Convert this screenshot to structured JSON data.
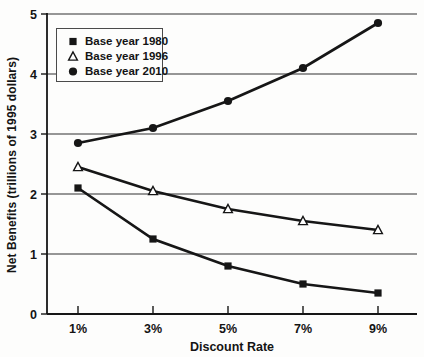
{
  "chart_data": {
    "type": "line",
    "title": "",
    "x_categories": [
      "1%",
      "3%",
      "5%",
      "7%",
      "9%"
    ],
    "series": [
      {
        "name": "Base year 1980",
        "marker": "filled-square",
        "values": [
          2.1,
          1.25,
          0.8,
          0.5,
          0.35
        ]
      },
      {
        "name": "Base year 1996",
        "marker": "open-triangle",
        "values": [
          2.45,
          2.05,
          1.75,
          1.55,
          1.4
        ]
      },
      {
        "name": "Base year 2010",
        "marker": "filled-circle",
        "values": [
          2.85,
          3.1,
          3.55,
          4.1,
          4.85
        ]
      }
    ],
    "xlabel": "Discount Rate",
    "ylabel": "Net Benefits (trillions of 1995 dollars)",
    "ylim": [
      0,
      5
    ],
    "yticks": [
      0,
      1,
      2,
      3,
      4,
      5
    ],
    "grid": "horizontal",
    "legend_position": "top-left",
    "line_color": "#161616",
    "grid_color": "#303030",
    "background": "#fdfdfc"
  }
}
